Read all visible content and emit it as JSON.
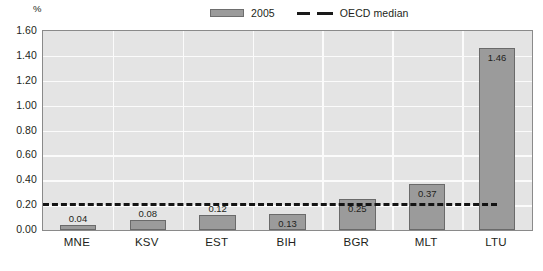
{
  "axis_unit": "%",
  "legend": {
    "series_label": "2005",
    "median_label": "OECD median",
    "series_color": "#9b9b9b",
    "median_color": "#141414"
  },
  "chart_data": {
    "type": "bar",
    "title": "",
    "xlabel": "",
    "ylabel": "%",
    "ylim": [
      0.0,
      1.6
    ],
    "ytick_step": 0.2,
    "grid": true,
    "legend_position": "top-right",
    "categories": [
      "MNE",
      "KSV",
      "EST",
      "BIH",
      "BGR",
      "MLT",
      "LTU"
    ],
    "values": [
      0.04,
      0.08,
      0.12,
      0.13,
      0.25,
      0.37,
      1.46
    ],
    "value_labels": [
      "0.04",
      "0.08",
      "0.12",
      "0.13",
      "0.25",
      "0.37",
      "1.46"
    ],
    "series": [
      {
        "name": "2005",
        "values": [
          0.04,
          0.08,
          0.12,
          0.13,
          0.25,
          0.37,
          1.46
        ]
      }
    ],
    "reference_line": {
      "name": "OECD median",
      "value": 0.22,
      "style": "dashed"
    },
    "ytick_labels": [
      "0.00",
      "0.20",
      "0.40",
      "0.60",
      "0.80",
      "1.00",
      "1.20",
      "1.40",
      "1.60"
    ]
  }
}
